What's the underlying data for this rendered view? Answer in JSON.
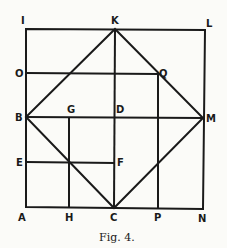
{
  "figure": {
    "caption": "Fig. 4.",
    "points": {
      "I": "I",
      "K": "K",
      "L": "L",
      "O": "O",
      "Q": "Q",
      "B": "B",
      "G": "G",
      "D": "D",
      "M": "M",
      "E": "E",
      "F": "F",
      "A": "A",
      "H": "H",
      "C": "C",
      "P": "P",
      "N": "N"
    }
  }
}
